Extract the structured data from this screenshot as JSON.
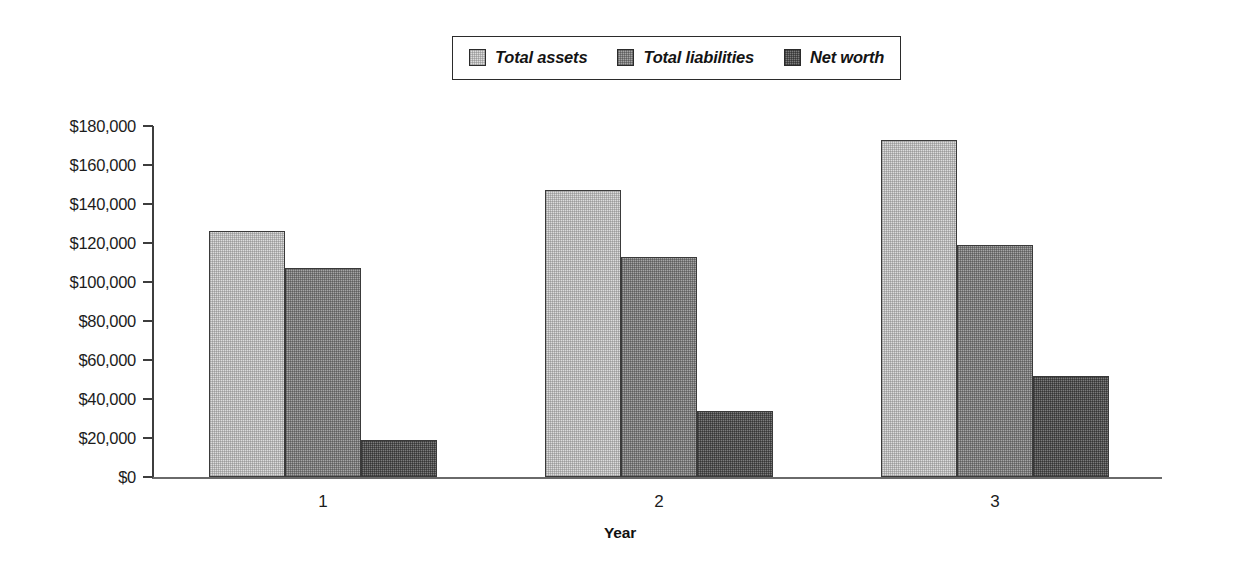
{
  "chart_data": {
    "type": "bar",
    "title": "",
    "xlabel": "Year",
    "ylabel": "",
    "categories": [
      "1",
      "2",
      "3"
    ],
    "series": [
      {
        "name": "Total assets",
        "values": [
          126000,
          147000,
          173000
        ],
        "color": "#dcdcdc"
      },
      {
        "name": "Total liabilities",
        "values": [
          107000,
          113000,
          119000
        ],
        "color": "#a6a6a6"
      },
      {
        "name": "Net worth",
        "values": [
          19000,
          34000,
          52000
        ],
        "color": "#7c7c7c"
      }
    ],
    "ylim": [
      0,
      180000
    ],
    "ytick_values": [
      0,
      20000,
      40000,
      60000,
      80000,
      100000,
      120000,
      140000,
      160000,
      180000
    ],
    "ytick_labels": [
      "$0",
      "$20,000",
      "$40,000",
      "$60,000",
      "$80,000",
      "$100,000",
      "$120,000",
      "$140,000",
      "$160,000",
      "$180,000"
    ],
    "grid": false,
    "legend_position": "top-center",
    "legend_entries": [
      "Total assets",
      "Total liabilities",
      "Net worth"
    ]
  },
  "legend": {
    "items": [
      {
        "label": "Total assets",
        "swatch": "legend-swatch-total-assets"
      },
      {
        "label": "Total liabilities",
        "swatch": "legend-swatch-total-liabilities"
      },
      {
        "label": "Net worth",
        "swatch": "legend-swatch-net-worth"
      }
    ]
  },
  "axes": {
    "x_title": "Year",
    "x_categories": [
      "1",
      "2",
      "3"
    ],
    "y_labels": [
      "$180,000",
      "$160,000",
      "$140,000",
      "$120,000",
      "$100,000",
      "$80,000",
      "$60,000",
      "$40,000",
      "$20,000",
      "$0"
    ]
  },
  "colors": {
    "total_assets": "#dcdcdc",
    "total_liabilities": "#a6a6a6",
    "net_worth": "#7c7c7c",
    "axis": "#3d3d3d",
    "text": "#1c1c1c",
    "background": "#ffffff"
  }
}
